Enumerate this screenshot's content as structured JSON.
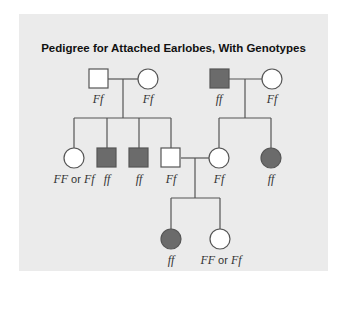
{
  "title": "Pedigree for Attached Earlobes, With Genotypes",
  "colors": {
    "affected": "#6b6b6b",
    "unaffected": "#ffffff",
    "line": "#555555",
    "panel": "#ebebeb"
  },
  "legend": {
    "or_word": "or"
  },
  "individuals": [
    {
      "id": "g1-father-left",
      "sex": "male",
      "affected": false,
      "genotype": "Ff"
    },
    {
      "id": "g1-mother-left",
      "sex": "female",
      "affected": false,
      "genotype": "Ff"
    },
    {
      "id": "g1-father-right",
      "sex": "male",
      "affected": true,
      "genotype": "ff"
    },
    {
      "id": "g1-mother-right",
      "sex": "female",
      "affected": false,
      "genotype": "Ff"
    },
    {
      "id": "g2-daughter-1",
      "sex": "female",
      "affected": false,
      "genotype_a": "FF",
      "genotype_b": "Ff"
    },
    {
      "id": "g2-son-1",
      "sex": "male",
      "affected": true,
      "genotype": "ff"
    },
    {
      "id": "g2-son-2",
      "sex": "male",
      "affected": true,
      "genotype": "ff"
    },
    {
      "id": "g2-son-3",
      "sex": "male",
      "affected": false,
      "genotype": "Ff"
    },
    {
      "id": "g2-daughter-right-1",
      "sex": "female",
      "affected": false,
      "genotype": "Ff"
    },
    {
      "id": "g2-daughter-right-2",
      "sex": "female",
      "affected": true,
      "genotype": "ff"
    },
    {
      "id": "g3-daughter-1",
      "sex": "female",
      "affected": true,
      "genotype": "ff"
    },
    {
      "id": "g3-daughter-2",
      "sex": "female",
      "affected": false,
      "genotype_a": "FF",
      "genotype_b": "Ff"
    }
  ]
}
